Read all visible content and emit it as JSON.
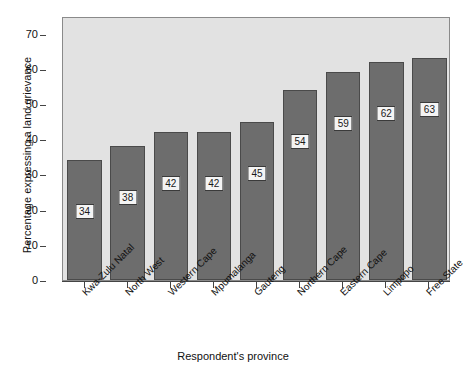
{
  "chart_data": {
    "type": "bar",
    "title": "",
    "subtitle": "",
    "xlabel": "Respondent's province",
    "ylabel": "Percentage expressing a land grievance",
    "categories": [
      "Kwa-Zulu Natal",
      "North West",
      "Western Cape",
      "Mpumalanga",
      "Gauteng",
      "Northern Cape",
      "Eastern Cape",
      "Limpopo",
      "Free State"
    ],
    "values": [
      34,
      38,
      42,
      42,
      45,
      54,
      59,
      62,
      63
    ],
    "data_labels": [
      "34",
      "38",
      "42",
      "42",
      "45",
      "54",
      "59",
      "62",
      "63"
    ],
    "ylim": [
      0,
      75
    ],
    "yticks": [
      0,
      10,
      20,
      30,
      40,
      50,
      60,
      70
    ],
    "ytick_labels": [
      "0",
      "10",
      "20",
      "30",
      "40",
      "50",
      "60",
      "70"
    ],
    "grid": false,
    "legend": null,
    "legend_position": "none",
    "colors": {
      "bar_fill": "#6d6d6d",
      "bar_edge": "#4a4a4a",
      "panel_background": "#e2e2e2",
      "panel_border": "#8a8a8a",
      "label_box_background": "#f4f4f4",
      "label_box_border": "#3a3a3a",
      "text": "#111111",
      "figure_background": "#ffffff"
    }
  }
}
